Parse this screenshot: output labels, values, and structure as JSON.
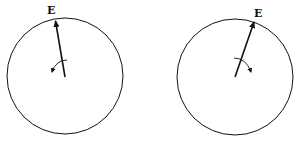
{
  "diagrams": [
    {
      "name": "left",
      "vector_label": "E",
      "rotation_direction": "counterclockwise"
    },
    {
      "name": "right",
      "vector_label": "E",
      "rotation_direction": "clockwise"
    }
  ],
  "colors": {
    "stroke": "#111111",
    "background": "#ffffff"
  }
}
